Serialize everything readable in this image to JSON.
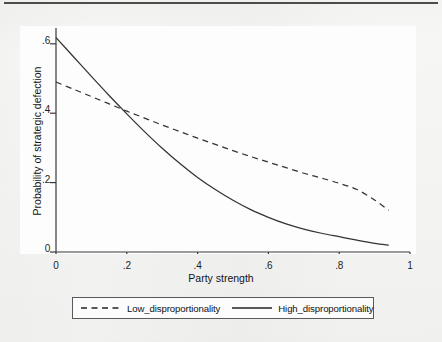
{
  "chart_data": {
    "type": "line",
    "title": "",
    "xlabel": "Party strength",
    "ylabel": "Probability of strategic defection",
    "xlim": [
      0,
      1
    ],
    "ylim": [
      0,
      0.65
    ],
    "grid": false,
    "legend_position": "below-plot",
    "xticks": [
      "0",
      ".2",
      ".4",
      ".6",
      ".8",
      "1"
    ],
    "xtick_values": [
      0,
      0.2,
      0.4,
      0.6,
      0.8,
      1
    ],
    "yticks": [
      "0",
      ".2",
      ".4",
      ".6"
    ],
    "ytick_values": [
      0,
      0.2,
      0.4,
      0.6
    ],
    "x": [
      0,
      0.05,
      0.1,
      0.15,
      0.2,
      0.25,
      0.3,
      0.35,
      0.4,
      0.45,
      0.5,
      0.55,
      0.6,
      0.65,
      0.7,
      0.75,
      0.8,
      0.85,
      0.9,
      0.94
    ],
    "series": [
      {
        "name": "Low_disproportionality",
        "style": "dashed",
        "color": "#333333",
        "values": [
          0.49,
          0.469,
          0.448,
          0.427,
          0.406,
          0.386,
          0.366,
          0.347,
          0.328,
          0.31,
          0.292,
          0.275,
          0.259,
          0.243,
          0.227,
          0.213,
          0.198,
          0.18,
          0.15,
          0.12
        ]
      },
      {
        "name": "High_disproportionality",
        "style": "solid",
        "color": "#333333",
        "values": [
          0.618,
          0.562,
          0.506,
          0.451,
          0.398,
          0.347,
          0.299,
          0.255,
          0.215,
          0.18,
          0.149,
          0.122,
          0.1,
          0.081,
          0.066,
          0.054,
          0.044,
          0.034,
          0.025,
          0.02
        ]
      }
    ],
    "annotations": [
      {
        "label": "curves-intersection",
        "x": 0.19,
        "y": 0.4
      }
    ]
  },
  "axes": {
    "x_title": "Party strength",
    "y_title": "Probability of strategic defection"
  },
  "legend": {
    "entries": [
      {
        "label": "Low_disproportionality",
        "style": "dashed"
      },
      {
        "label": "High_disproportionality",
        "style": "solid"
      }
    ]
  },
  "colors": {
    "page_background": "#f6f6f5",
    "plot_background": "#fdfdfd",
    "line": "#333333",
    "axis": "#3a3a3a",
    "text": "#141414",
    "top_rule": "#4c4c4c",
    "legend_border": "#5a5a5a"
  }
}
